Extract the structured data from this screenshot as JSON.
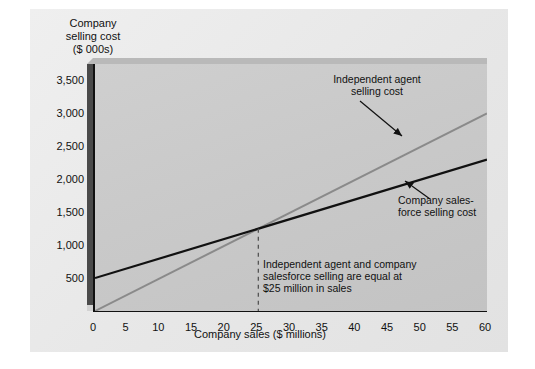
{
  "chart_data": {
    "type": "line",
    "title": "",
    "ylabel_lines": [
      "Company",
      "selling cost",
      "($ 000s)"
    ],
    "xlabel": "Company sales ($ millions)",
    "xlim": [
      0,
      60
    ],
    "ylim": [
      0,
      3750
    ],
    "xticks": [
      0,
      5,
      10,
      15,
      20,
      25,
      30,
      35,
      40,
      45,
      50,
      55,
      60
    ],
    "xtick_labels": [
      "0",
      "5",
      "10",
      "15",
      "20",
      "25",
      "30",
      "35",
      "40",
      "45",
      "50",
      "55",
      "60"
    ],
    "yticks": [
      500,
      1000,
      1500,
      2000,
      2500,
      3000,
      3500
    ],
    "ytick_labels": [
      "500",
      "1,000",
      "1,500",
      "2,000",
      "2,500",
      "3,000",
      "3,500"
    ],
    "grid": false,
    "legend": "none",
    "series": [
      {
        "name": "Independent agent selling cost",
        "color": "#8a8a8a",
        "x": [
          0,
          60
        ],
        "values": [
          0,
          3000
        ]
      },
      {
        "name": "Company salesforce selling cost",
        "color": "#111111",
        "x": [
          0,
          60
        ],
        "values": [
          500,
          2300
        ]
      }
    ],
    "intersection": {
      "x": 25,
      "y": 1250
    },
    "annotations": [
      {
        "id": "independent-agent",
        "lines": [
          "Independent agent",
          "selling cost"
        ]
      },
      {
        "id": "company-salesforce",
        "lines": [
          "Company sales-",
          "force selling cost"
        ]
      },
      {
        "id": "break-even-note",
        "lines": [
          "Independent agent and company",
          "salesforce selling are equal at",
          "$25 million in sales"
        ]
      }
    ]
  },
  "labels": {
    "ytitle_l1": "Company",
    "ytitle_l2": "selling cost",
    "ytitle_l3": "($ 000s)",
    "xtitle": "Company sales ($ millions)",
    "agent_l1": "Independent agent",
    "agent_l2": "selling cost",
    "sales_l1": "Company sales-",
    "sales_l2": "force selling cost",
    "equal_l1": "Independent agent and company",
    "equal_l2": "salesforce selling are equal at",
    "equal_l3": "$25 million in sales"
  },
  "colors": {
    "agent_line": "#8a8a8a",
    "salesforce_line": "#111111",
    "plot_bg": "#c9c9c9",
    "figure_bg": "#e9e9e9",
    "axis": "#111111",
    "dash": "#555555"
  }
}
